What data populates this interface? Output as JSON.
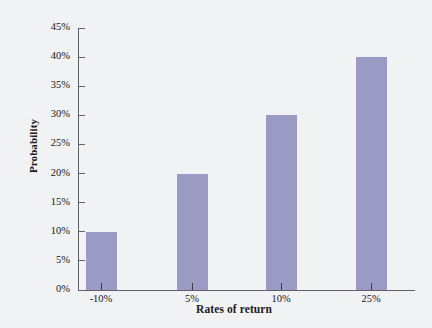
{
  "chart_data": {
    "type": "bar",
    "title": "",
    "xlabel": "Rates of return",
    "ylabel": "Probability",
    "categories": [
      "-10%",
      "5%",
      "10%",
      "25%"
    ],
    "values": [
      10,
      20,
      30,
      40
    ],
    "value_labels": [
      "10%",
      "20%",
      "30%",
      "40%"
    ],
    "ylim": [
      0,
      45
    ],
    "ytick_values": [
      0,
      5,
      10,
      15,
      20,
      25,
      30,
      35,
      40,
      45
    ],
    "ytick_labels": [
      "0%",
      "5%",
      "10%",
      "15%",
      "20%",
      "25%",
      "30%",
      "35%",
      "40%",
      "45%"
    ],
    "grid": false,
    "legend": false,
    "bar_color": "#9b9ac4",
    "axis_color": "#5f6068",
    "background_color": "#f1f2f3"
  }
}
